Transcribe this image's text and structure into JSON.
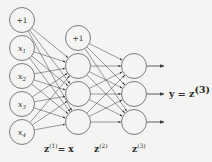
{
  "figure": {
    "background_color": "#f4f4f2",
    "stroke_color": "#4a4a4a",
    "node_stroke_color": "#6e6e6e",
    "text_color": "#2b2b2b"
  },
  "layers": {
    "input": {
      "layer_label": "z",
      "layer_label_sup": "(1)",
      "layer_label_suffix": "= x",
      "nodes": [
        {
          "label": "+1",
          "kind": "bias"
        },
        {
          "label": "x",
          "sub": "1",
          "kind": "input"
        },
        {
          "label": "x",
          "sub": "2",
          "kind": "input"
        },
        {
          "label": "x",
          "sub": "3",
          "kind": "input"
        },
        {
          "label": "x",
          "sub": "4",
          "kind": "input"
        }
      ]
    },
    "hidden": {
      "layer_label": "z",
      "layer_label_sup": "(2)",
      "nodes": [
        {
          "label": "+1",
          "kind": "bias"
        },
        {
          "label": "",
          "kind": "hidden"
        },
        {
          "label": "",
          "kind": "hidden"
        },
        {
          "label": "",
          "kind": "hidden"
        }
      ]
    },
    "output": {
      "layer_label": "z",
      "layer_label_sup": "(3)",
      "nodes": [
        {
          "label": "",
          "kind": "output"
        },
        {
          "label": "",
          "kind": "output"
        },
        {
          "label": "",
          "kind": "output"
        }
      ]
    }
  },
  "annotations": {
    "output_equation": "y = z",
    "output_equation_sup": "(3)"
  },
  "geometry": {
    "input_x": 22,
    "input_ys": [
      20,
      48,
      76,
      104,
      132
    ],
    "hidden_x": 78,
    "hidden_bias_y": 38,
    "hidden_ys": [
      66,
      94,
      122
    ],
    "output_x": 134,
    "output_ys": [
      66,
      94,
      122
    ],
    "radius_input": 12.5,
    "radius_hidden": 12.5,
    "radius_output": 12.5,
    "arrow_end_x": 164
  }
}
